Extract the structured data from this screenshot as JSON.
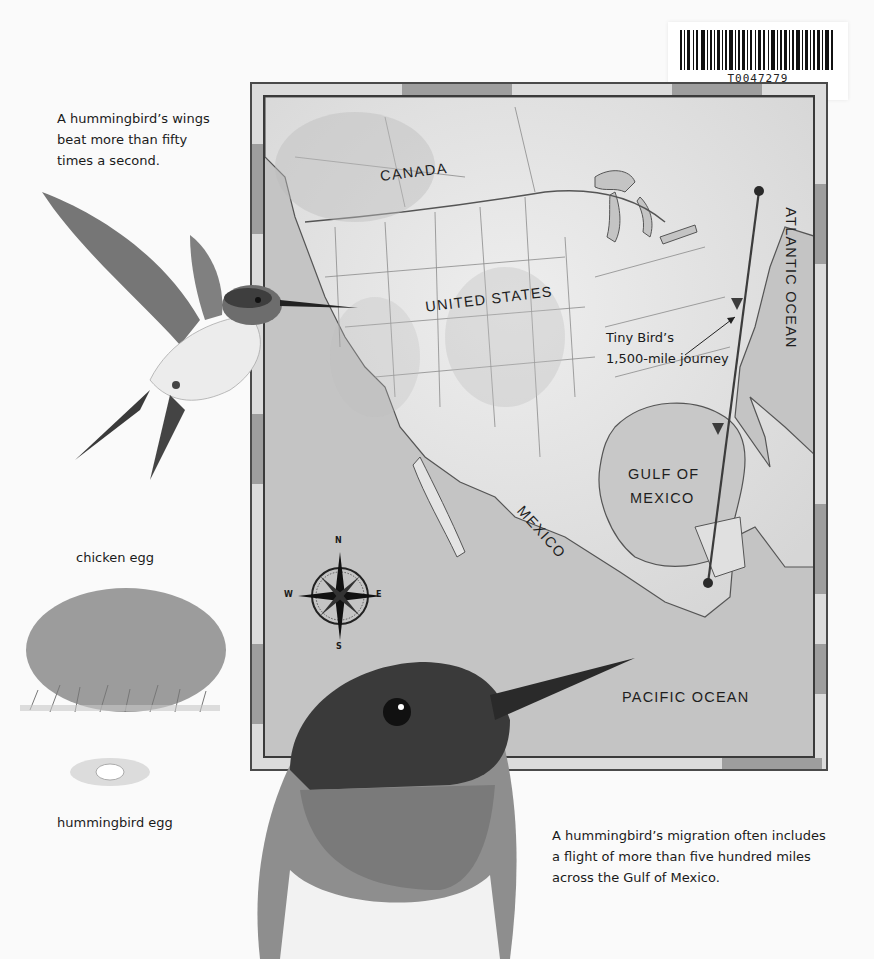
{
  "barcode": {
    "code": "T0047279"
  },
  "captions": {
    "wings": [
      "A hummingbird’s wings",
      "beat more than fifty",
      "times a second."
    ],
    "chicken_egg": "chicken egg",
    "hummingbird_egg": "hummingbird egg",
    "migration": [
      "A hummingbird’s migration often includes",
      "a flight of more than five hundred miles",
      "across the Gulf of Mexico."
    ]
  },
  "map": {
    "labels": {
      "canada": "CANADA",
      "united_states": "UNITED STATES",
      "atlantic_ocean": "ATLANTIC OCEAN",
      "gulf_of_mexico": [
        "GULF OF",
        "MEXICO"
      ],
      "mexico": "MEXICO",
      "pacific_ocean": "PACIFIC OCEAN"
    },
    "journey_annotation": [
      "Tiny Bird’s",
      "1,500-mile journey"
    ],
    "compass": {
      "n": "N",
      "s": "S",
      "e": "E",
      "w": "W"
    },
    "colors": {
      "land": "#e8e8e8",
      "water": "#b8b8b8",
      "route": "#3c3c3c",
      "frame": "#4a4a4a"
    }
  }
}
